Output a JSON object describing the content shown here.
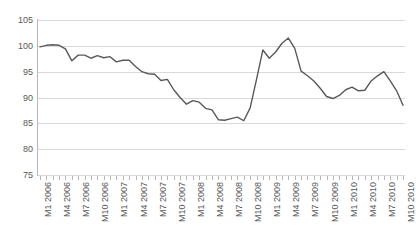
{
  "chart_data": {
    "type": "line",
    "title": "",
    "subtitle": "",
    "xlabel": "",
    "ylabel": "",
    "ylim": [
      75,
      105
    ],
    "yticks": [
      75,
      80,
      85,
      90,
      95,
      100,
      105
    ],
    "grid": true,
    "legend": false,
    "legend_position": "none",
    "line_color": "#595959",
    "line_width": 1.4,
    "markers": false,
    "x_tick_label_rotation": -90,
    "x_label_interval": 3,
    "x": [
      "M1 2006",
      "M2 2006",
      "M3 2006",
      "M4 2006",
      "M5 2006",
      "M6 2006",
      "M7 2006",
      "M8 2006",
      "M9 2006",
      "M10 2006",
      "M11 2006",
      "M12 2006",
      "M1 2007",
      "M2 2007",
      "M3 2007",
      "M4 2007",
      "M5 2007",
      "M6 2007",
      "M7 2007",
      "M8 2007",
      "M9 2007",
      "M10 2007",
      "M11 2007",
      "M12 2007",
      "M1 2008",
      "M2 2008",
      "M3 2008",
      "M4 2008",
      "M5 2008",
      "M6 2008",
      "M7 2008",
      "M8 2008",
      "M9 2008",
      "M10 2008",
      "M11 2008",
      "M12 2008",
      "M1 2009",
      "M2 2009",
      "M3 2009",
      "M4 2009",
      "M5 2009",
      "M6 2009",
      "M7 2009",
      "M8 2009",
      "M9 2009",
      "M10 2009",
      "M11 2009",
      "M12 2009",
      "M1 2010",
      "M2 2010",
      "M3 2010",
      "M4 2010",
      "M5 2010",
      "M6 2010",
      "M7 2010",
      "M8 2010",
      "M9 2010",
      "M10 2010"
    ],
    "tick_labels_shown": [
      "M1 2006",
      "M4 2006",
      "M7 2006",
      "M10 2006",
      "M1 2007",
      "M4 2007",
      "M7 2007",
      "M10 2007",
      "M1 2008",
      "M4 2008",
      "M7 2008",
      "M10 2008",
      "M1 2009",
      "M4 2009",
      "M7 2009",
      "M10 2009",
      "M1 2010",
      "M4 2010",
      "M7 2010",
      "M10 2010"
    ],
    "values": [
      99.8,
      100.1,
      100.2,
      100.1,
      99.4,
      97.1,
      98.2,
      98.2,
      97.6,
      98.1,
      97.7,
      97.9,
      96.9,
      97.2,
      97.2,
      96.0,
      95.0,
      94.6,
      94.5,
      93.3,
      93.5,
      91.5,
      90.0,
      88.7,
      89.4,
      89.1,
      87.9,
      87.6,
      85.7,
      85.6,
      85.9,
      86.2,
      85.5,
      88.0,
      93.5,
      99.2,
      97.6,
      98.8,
      100.5,
      101.5,
      99.5,
      95.1,
      94.2,
      93.2,
      91.8,
      90.2,
      89.8,
      90.4,
      91.5,
      92.0,
      91.3,
      91.4,
      93.2,
      94.2,
      95.0,
      93.2,
      91.3,
      88.5
    ]
  }
}
